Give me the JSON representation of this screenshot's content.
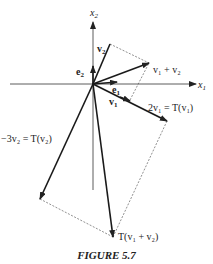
{
  "figure": {
    "caption": "FIGURE 5.7",
    "axes": {
      "x_label": "x",
      "x_sub": "1",
      "y_label": "x",
      "y_sub": "2"
    },
    "vectors": [
      {
        "name": "e1",
        "label": "e",
        "sub": "1"
      },
      {
        "name": "e2",
        "label": "e",
        "sub": "2"
      },
      {
        "name": "v1",
        "label": "v",
        "sub": "1"
      },
      {
        "name": "v2",
        "label": "v",
        "sub": "2"
      },
      {
        "name": "v1+v2",
        "label": "v₁ + v₂"
      },
      {
        "name": "2v1",
        "label": "2v₁ = T(v₁)"
      },
      {
        "name": "-3v2",
        "label": "−3v₂ = T(v₂)"
      },
      {
        "name": "T(v1+v2)",
        "label": "T(v₁ + v₂)"
      }
    ],
    "colors": {
      "ink": "#222222",
      "background": "#ffffff"
    }
  }
}
